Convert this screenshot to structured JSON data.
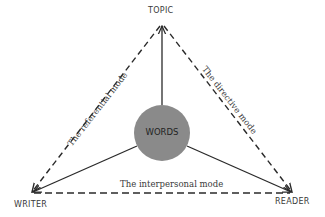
{
  "nodes": {
    "top": "TOPIC",
    "left": "WRITER",
    "right": "READER",
    "center": "WORDS"
  },
  "edges": {
    "left": "The referential mode",
    "right": "The directive mode",
    "bottom": "The interpersonal mode"
  },
  "colors": {
    "circle": "#8a8a8a",
    "line": "#2a2a2a",
    "text": "#3a3a3a"
  }
}
